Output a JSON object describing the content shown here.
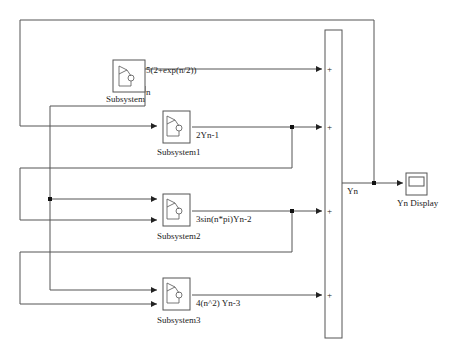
{
  "blocks": {
    "subsystem": {
      "name": "Subsystem",
      "output_label": "5(2+exp(n/2))",
      "port_label": "n"
    },
    "subsystem1": {
      "name": "Subsystem1",
      "output_label": "2Yn-1"
    },
    "subsystem2": {
      "name": "Subsystem2",
      "output_label": "3sin(n*pi)Yn-2"
    },
    "subsystem3": {
      "name": "Subsystem3",
      "output_label": "4(n^2) Yn-3"
    },
    "sum": {
      "signs": [
        "+",
        "+",
        "+",
        "+"
      ]
    },
    "display": {
      "name": "Yn Display"
    }
  },
  "signals": {
    "sum_output": "Yn"
  },
  "colors": {
    "line": "#555555",
    "block_border": "#555555",
    "background": "#ffffff"
  }
}
